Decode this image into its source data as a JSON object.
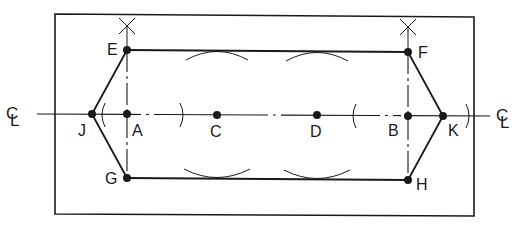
{
  "diagram": {
    "colors": {
      "stroke": "#1a1a1a",
      "background": "#ffffff"
    },
    "frame": {
      "x1": 55,
      "y1": 14,
      "x2": 474,
      "y2": 216
    },
    "centerline": {
      "y_left": 114,
      "y_right": 116,
      "x_start": 37,
      "x_end": 490,
      "symbol_left": "CL",
      "symbol_right": "CL"
    },
    "points": [
      {
        "id": "E",
        "label": "E",
        "x": 127,
        "y": 50,
        "label_dx": -20,
        "label_dy": 5
      },
      {
        "id": "F",
        "label": "F",
        "x": 408,
        "y": 52,
        "label_dx": 10,
        "label_dy": 6
      },
      {
        "id": "G",
        "label": "G",
        "x": 127,
        "y": 178,
        "label_dx": -22,
        "label_dy": 6
      },
      {
        "id": "H",
        "label": "H",
        "x": 408,
        "y": 180,
        "label_dx": 8,
        "label_dy": 10
      },
      {
        "id": "J",
        "label": "J",
        "x": 92,
        "y": 114,
        "label_dx": -14,
        "label_dy": 22
      },
      {
        "id": "K",
        "label": "K",
        "x": 443,
        "y": 116,
        "label_dx": 5,
        "label_dy": 20
      },
      {
        "id": "A",
        "label": "A",
        "x": 127,
        "y": 114,
        "label_dx": 5,
        "label_dy": 22
      },
      {
        "id": "B",
        "label": "B",
        "x": 408,
        "y": 116,
        "label_dx": -20,
        "label_dy": 20
      },
      {
        "id": "C",
        "label": "C",
        "x": 217,
        "y": 115,
        "label_dx": -7,
        "label_dy": 22
      },
      {
        "id": "D",
        "label": "D",
        "x": 317,
        "y": 115,
        "label_dx": -7,
        "label_dy": 22
      }
    ],
    "edges": [
      [
        "E",
        "F"
      ],
      [
        "F",
        "K"
      ],
      [
        "K",
        "H"
      ],
      [
        "H",
        "G"
      ],
      [
        "G",
        "J"
      ],
      [
        "J",
        "E"
      ]
    ],
    "construction_marks": {
      "x_marks": [
        {
          "x": 127,
          "y": 26
        },
        {
          "x": 408,
          "y": 27
        }
      ],
      "top_arcs": [
        {
          "x1": 186,
          "x2": 248,
          "y": 51
        },
        {
          "x1": 286,
          "x2": 348,
          "y": 52
        }
      ],
      "bottom_arcs": [
        {
          "x1": 184,
          "x2": 250,
          "y": 178
        },
        {
          "x1": 284,
          "x2": 350,
          "y": 179
        }
      ],
      "centerline_arcs": [
        {
          "x": 103,
          "y": 115,
          "dir": "left"
        },
        {
          "x": 182,
          "y": 115,
          "dir": "right"
        },
        {
          "x": 354,
          "y": 116,
          "dir": "left"
        },
        {
          "x": 468,
          "y": 116,
          "dir": "right"
        }
      ]
    }
  }
}
